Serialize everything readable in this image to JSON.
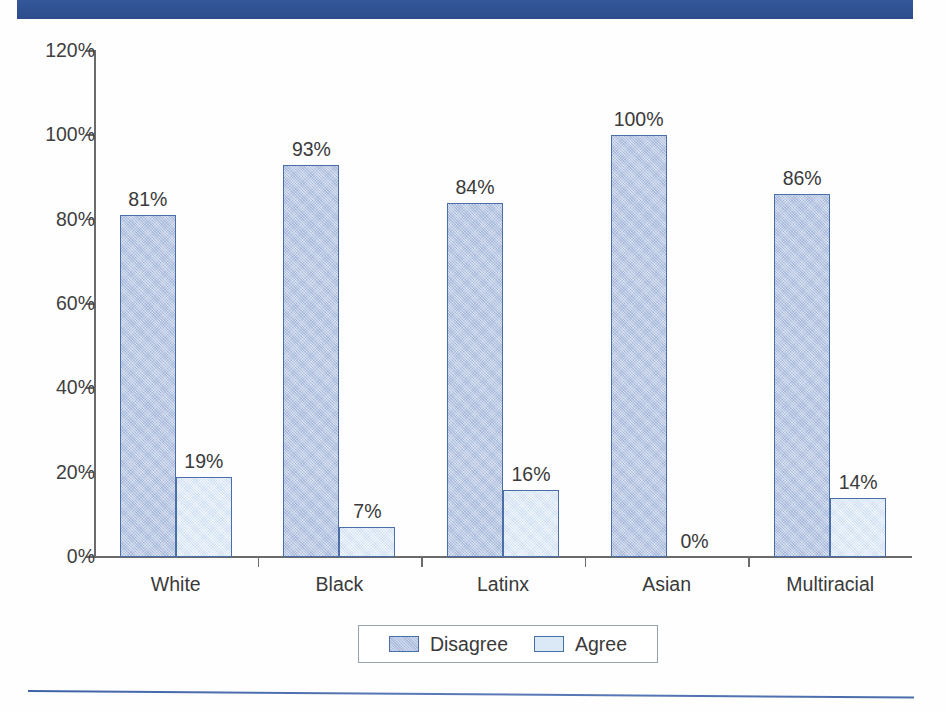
{
  "title_bar": {
    "text": "",
    "color": "#2f5596"
  },
  "chart_data": {
    "type": "bar",
    "title": "",
    "xlabel": "",
    "ylabel": "",
    "categories": [
      "White",
      "Black",
      "Latinx",
      "Asian",
      "Multiracial"
    ],
    "series": [
      {
        "name": "Disagree",
        "color": "#b5c4e2",
        "values": [
          81,
          93,
          84,
          100,
          86
        ],
        "labels": [
          "81%",
          "93%",
          "84%",
          "100%",
          "86%"
        ]
      },
      {
        "name": "Agree",
        "color": "#dbe8f6",
        "values": [
          19,
          7,
          16,
          0,
          14
        ],
        "labels": [
          "19%",
          "7%",
          "16%",
          "0%",
          "14%"
        ]
      }
    ],
    "ylim": [
      0,
      120
    ],
    "ytick_values": [
      0,
      20,
      40,
      60,
      80,
      100,
      120
    ],
    "ytick_labels": [
      "0%",
      "20%",
      "40%",
      "60%",
      "80%",
      "100%",
      "120%"
    ],
    "grid": false,
    "legend_position": "bottom",
    "legend_entries": [
      "Disagree",
      "Agree"
    ]
  },
  "legend": {
    "entries": [
      {
        "label": "Disagree",
        "swatch": "disagree"
      },
      {
        "label": "Agree",
        "swatch": "agree"
      }
    ]
  }
}
